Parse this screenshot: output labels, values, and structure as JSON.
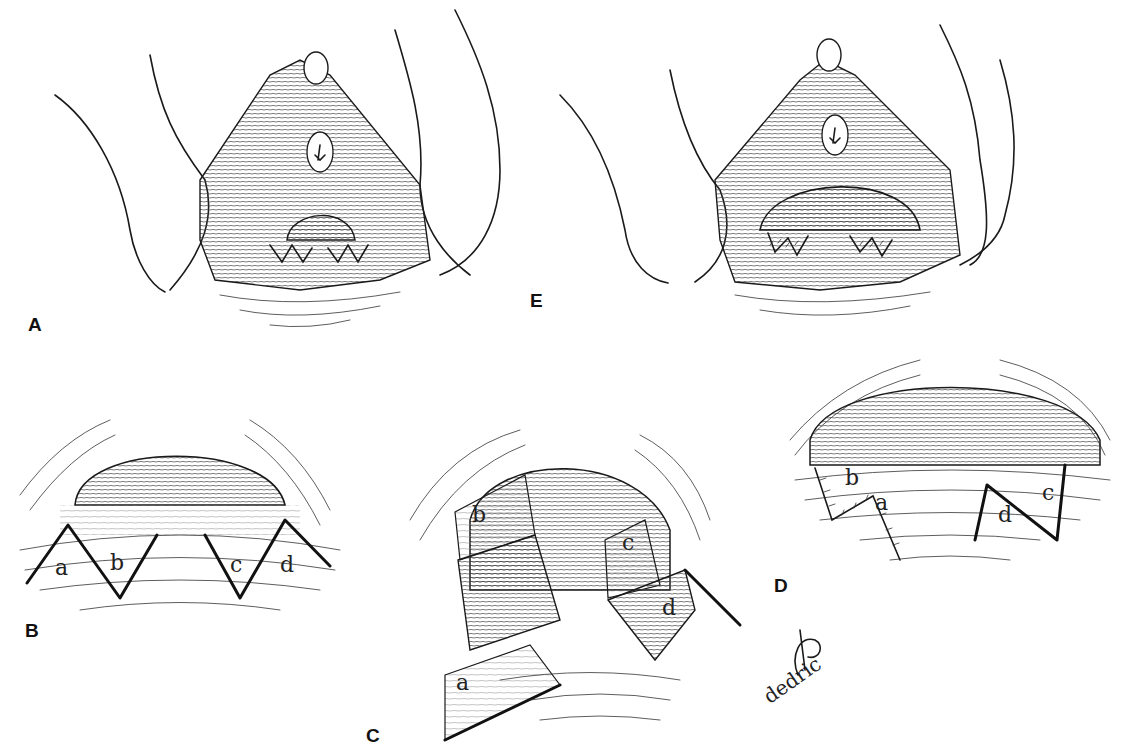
{
  "figure": {
    "panels": [
      {
        "id": "A",
        "letter": "A",
        "description": "Preoperative perineal view with V-shaped incision markings below introitus"
      },
      {
        "id": "B",
        "letter": "B",
        "description": "Close-up of introitus with two V-shaped incisions",
        "flap_labels": [
          "a",
          "b",
          "c",
          "d"
        ]
      },
      {
        "id": "C",
        "letter": "C",
        "description": "Flaps a, b, c, d raised and transposed",
        "flap_labels": [
          "a",
          "b",
          "c",
          "d"
        ]
      },
      {
        "id": "D",
        "letter": "D",
        "description": "Flaps sutured in transposed position",
        "flap_labels": [
          "b",
          "a",
          "d",
          "c"
        ]
      },
      {
        "id": "E",
        "letter": "E",
        "description": "Postoperative perineal view with widened introitus and suture lines"
      }
    ],
    "signature": "dedric"
  },
  "colors": {
    "ink": "#1a1a1a",
    "paper": "#ffffff"
  }
}
